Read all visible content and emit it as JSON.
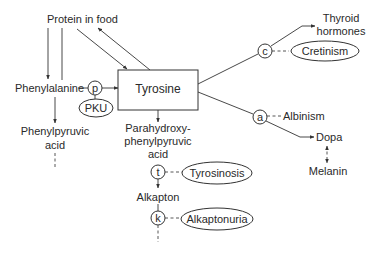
{
  "diagram": {
    "type": "metabolic pathway",
    "nodes": {
      "protein": "Protein in food",
      "phenylalanine": "Phenylalanine",
      "tyrosine": "Tyrosine",
      "phenylpyruvic_1": "Phenylpyruvic",
      "phenylpyruvic_2": "acid",
      "parahydroxy_1": "Parahydroxy-",
      "parahydroxy_2": "phenylpyruvic",
      "parahydroxy_3": "acid",
      "alkapton": "Alkapton",
      "thyroid_1": "Thyroid",
      "thyroid_2": "hormones",
      "dopa": "Dopa",
      "melanin": "Melanin"
    },
    "enzymes": {
      "p": "p",
      "t": "t",
      "k": "k",
      "c": "c",
      "a": "a"
    },
    "disorders": {
      "pku": "PKU",
      "tyrosinosis": "Tyrosinosis",
      "alkaptonuria": "Alkaptonuria",
      "cretinism": "Cretinism",
      "albinism": "Albinism"
    },
    "colors": {
      "line": "#333333",
      "text": "#2a2a2a",
      "background": "#ffffff"
    }
  }
}
